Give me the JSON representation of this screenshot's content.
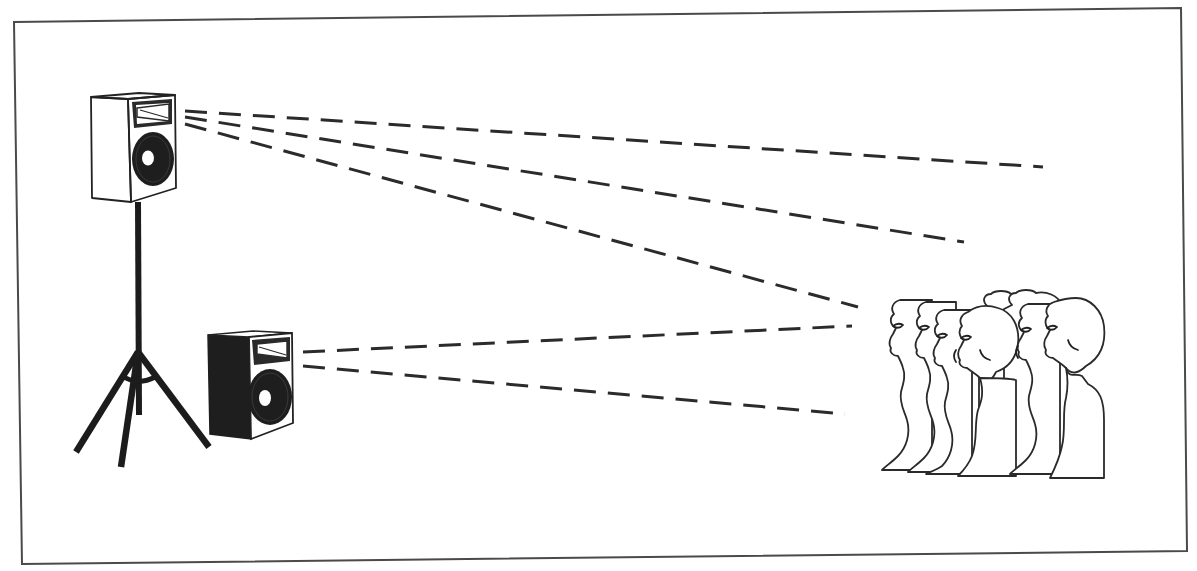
{
  "diagram": {
    "title": "Speaker placement and sound dispersion toward audience",
    "colors": {
      "background": "#ffffff",
      "ink": "#222222",
      "frame": "#4a4a4a",
      "cabinet_dark": "#1e1e1e"
    },
    "elements": {
      "upper_speaker": {
        "label": "Elevated speaker on tripod stand",
        "cabinet": "white",
        "mount": "tripod-stand"
      },
      "lower_speaker": {
        "label": "Floor-level speaker",
        "cabinet": "black"
      },
      "audience": {
        "label": "Audience",
        "count": 7
      },
      "upper_beams": {
        "label": "Sound paths from elevated speaker",
        "count": 3
      },
      "lower_beams": {
        "label": "Sound paths from floor speaker",
        "count": 2
      }
    }
  }
}
